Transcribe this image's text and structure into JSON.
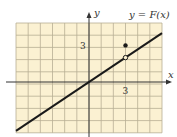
{
  "title": "y = F(x)",
  "axes": {
    "x_label": "x",
    "y_label": "y"
  },
  "ticks": {
    "x_tick": "3",
    "y_tick": "3"
  },
  "colors": {
    "grid_bg": "#fbf1d2",
    "grid_line": "#b8ae94",
    "curve": "#1a1a1a"
  },
  "chart_data": {
    "type": "line",
    "title": "y = F(x)",
    "xlabel": "x",
    "ylabel": "y",
    "xlim": [
      -6,
      6
    ],
    "ylim": [
      -4,
      5
    ],
    "grid": true,
    "series": [
      {
        "name": "F(x) = 2x/3 (x ≠ 3)",
        "x": [
          -6,
          6
        ],
        "y": [
          -4,
          4
        ]
      }
    ],
    "points": [
      {
        "x": 3,
        "y": 2,
        "style": "open"
      },
      {
        "x": 3,
        "y": 3,
        "style": "filled"
      }
    ]
  }
}
